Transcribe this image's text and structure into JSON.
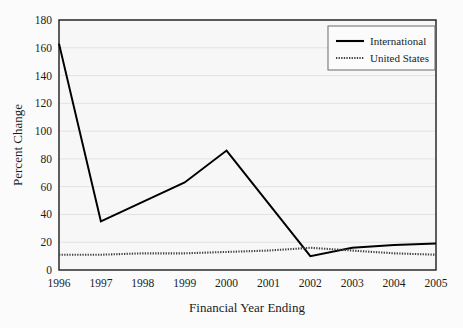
{
  "chart_data": {
    "type": "line",
    "title": "",
    "xlabel": "Financial Year Ending",
    "ylabel": "Percent Change",
    "categories": [
      "1996",
      "1997",
      "1998",
      "1999",
      "2000",
      "2001",
      "2002",
      "2003",
      "2004",
      "2005"
    ],
    "xlim": [
      1996,
      2005
    ],
    "ylim": [
      0,
      180
    ],
    "ytick_step": 20,
    "yticks": [
      "0",
      "20",
      "40",
      "60",
      "80",
      "100",
      "120",
      "140",
      "160",
      "180"
    ],
    "grid": "horizontal",
    "legend_position": "top-right",
    "series": [
      {
        "name": "International",
        "style": "solid",
        "color": "#000000",
        "values": [
          163,
          35,
          49,
          63,
          86,
          48,
          10,
          16,
          18,
          19
        ]
      },
      {
        "name": "United States",
        "style": "dotted",
        "color": "#404040",
        "values": [
          11,
          11,
          12,
          12,
          13,
          14,
          16,
          14,
          12,
          11
        ]
      }
    ]
  },
  "legend": {
    "items": [
      {
        "label": "International"
      },
      {
        "label": "United States"
      }
    ]
  },
  "axes": {
    "x_title": "Financial Year Ending",
    "y_title": "Percent Change"
  }
}
